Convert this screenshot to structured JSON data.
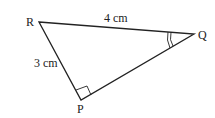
{
  "diagram": {
    "type": "right-triangle",
    "vertices": {
      "R": {
        "label": "R",
        "x": 39,
        "y": 22
      },
      "Q": {
        "label": "Q",
        "x": 194,
        "y": 34
      },
      "P": {
        "label": "P",
        "x": 81,
        "y": 100
      }
    },
    "sides": {
      "RQ": {
        "label": "4 cm"
      },
      "RP": {
        "label": "3 cm"
      }
    },
    "markers": {
      "right_angle_at": "P",
      "double_arc_at": "Q"
    },
    "colors": {
      "stroke": "#222222",
      "background": "#ffffff"
    }
  }
}
